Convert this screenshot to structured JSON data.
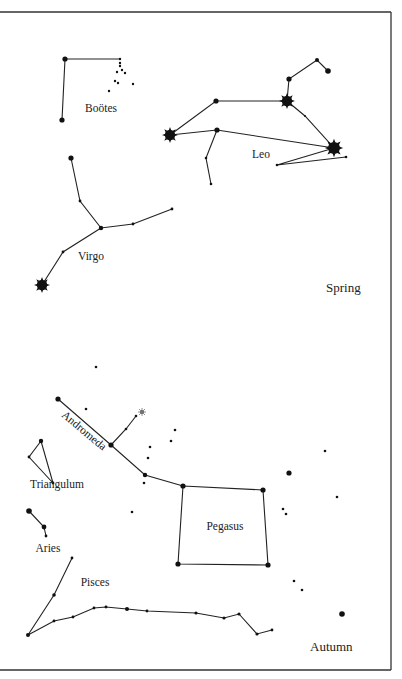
{
  "seasons": {
    "spring": "Spring",
    "autumn": "Autumn"
  },
  "constellations": [
    {
      "name": "Boötes",
      "label_pos": [
        101,
        108
      ]
    },
    {
      "name": "Leo",
      "label_pos": [
        262,
        155
      ]
    },
    {
      "name": "Virgo",
      "label_pos": [
        91,
        259
      ]
    },
    {
      "name": "Andromeda",
      "label_pos": [
        78,
        422
      ],
      "label_rotation": 40
    },
    {
      "name": "Triangulum",
      "label_pos": [
        58,
        487
      ]
    },
    {
      "name": "Pegasus",
      "label_pos": [
        225,
        528
      ]
    },
    {
      "name": "Aries",
      "label_pos": [
        49,
        549
      ]
    },
    {
      "name": "Pisces",
      "label_pos": [
        95,
        584
      ]
    }
  ],
  "colors": {
    "ink": "#111111",
    "background": "#ffffff"
  }
}
